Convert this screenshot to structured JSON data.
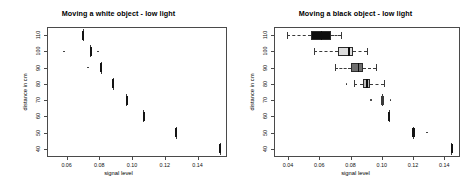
{
  "figure": {
    "panel_count": 2,
    "background": "#ffffff",
    "frame_color": "#4a4a4a"
  },
  "panels": [
    {
      "id": "white-object-panel",
      "title": "Moving a white object - low light",
      "xlabel": "signal level",
      "ylabel": "distance in cm",
      "xticks": [
        "0.06",
        "0.08",
        "0.10",
        "0.12",
        "0.14"
      ],
      "yticks": [
        "110",
        "100",
        "90",
        "80",
        "70",
        "60",
        "50",
        "40"
      ]
    },
    {
      "id": "black-object-panel",
      "title": "Moving a black object - low light",
      "xlabel": "signal level",
      "ylabel": "distance in cm",
      "xticks": [
        "0.04",
        "0.06",
        "0.08",
        "0.10",
        "0.12",
        "0.14"
      ],
      "yticks": [
        "110",
        "100",
        "90",
        "80",
        "70",
        "60",
        "50",
        "40"
      ]
    }
  ],
  "chart_data": [
    {
      "type": "boxplot",
      "orientation": "horizontal",
      "title": "Moving a white object - low light",
      "xlabel": "signal level",
      "ylabel": "distance in cm",
      "xlim": [
        0.048,
        0.158
      ],
      "ylim": [
        35,
        115
      ],
      "grid": false,
      "legend": "none",
      "categories": [
        110,
        100,
        90,
        80,
        70,
        60,
        50,
        40
      ],
      "boxes": [
        {
          "category": 110,
          "min": 0.0695,
          "q1": 0.07,
          "median": 0.0702,
          "q3": 0.0705,
          "max": 0.071,
          "fill": "#141414",
          "outliers": []
        },
        {
          "category": 100,
          "min": 0.074,
          "q1": 0.0744,
          "median": 0.0746,
          "q3": 0.0749,
          "max": 0.0754,
          "fill": "#141414",
          "outliers": [
            0.0585,
            0.0792
          ]
        },
        {
          "category": 90,
          "min": 0.0806,
          "q1": 0.081,
          "median": 0.0812,
          "q3": 0.0815,
          "max": 0.082,
          "fill": "#141414",
          "outliers": [
            0.073
          ]
        },
        {
          "category": 80,
          "min": 0.0878,
          "q1": 0.0882,
          "median": 0.0884,
          "q3": 0.0887,
          "max": 0.0892,
          "fill": "#141414",
          "outliers": []
        },
        {
          "category": 70,
          "min": 0.0962,
          "q1": 0.0966,
          "median": 0.0968,
          "q3": 0.0971,
          "max": 0.0977,
          "fill": "#141414",
          "outliers": []
        },
        {
          "category": 60,
          "min": 0.1064,
          "q1": 0.1068,
          "median": 0.107,
          "q3": 0.1073,
          "max": 0.108,
          "fill": "#141414",
          "outliers": []
        },
        {
          "category": 50,
          "min": 0.1262,
          "q1": 0.1266,
          "median": 0.1269,
          "q3": 0.1272,
          "max": 0.1279,
          "fill": "#141414",
          "outliers": []
        },
        {
          "category": 40,
          "min": 0.153,
          "q1": 0.1535,
          "median": 0.1538,
          "q3": 0.1541,
          "max": 0.1548,
          "fill": "#141414",
          "outliers": []
        }
      ]
    },
    {
      "type": "boxplot",
      "orientation": "horizontal",
      "title": "Moving a black object - low light",
      "xlabel": "signal level",
      "ylabel": "distance in cm",
      "xlim": [
        0.031,
        0.15
      ],
      "ylim": [
        35,
        115
      ],
      "grid": false,
      "legend": "none",
      "categories": [
        110,
        100,
        90,
        80,
        70,
        60,
        50,
        40
      ],
      "boxes": [
        {
          "category": 110,
          "min": 0.039,
          "q1": 0.0545,
          "median": 0.0615,
          "q3": 0.0672,
          "max": 0.074,
          "fill": "#0d0d0d",
          "outliers": []
        },
        {
          "category": 100,
          "min": 0.0565,
          "q1": 0.072,
          "median": 0.079,
          "q3": 0.0815,
          "max": 0.0905,
          "fill": "#dcdcdc",
          "outliers": []
        },
        {
          "category": 90,
          "min": 0.07,
          "q1": 0.08,
          "median": 0.085,
          "q3": 0.088,
          "max": 0.0965,
          "fill": "#6e6e6e",
          "outliers": []
        },
        {
          "category": 80,
          "min": 0.082,
          "q1": 0.088,
          "median": 0.0905,
          "q3": 0.0925,
          "max": 0.1015,
          "fill": "#bdbdbd",
          "outliers": [
            0.0775
          ]
        },
        {
          "category": 70,
          "min": 0.0985,
          "q1": 0.1,
          "median": 0.1005,
          "q3": 0.101,
          "max": 0.103,
          "fill": "#3a3a3a",
          "outliers": [
            0.093,
            0.1055
          ]
        },
        {
          "category": 60,
          "min": 0.104,
          "q1": 0.1044,
          "median": 0.1046,
          "q3": 0.1049,
          "max": 0.1055,
          "fill": "#141414",
          "outliers": []
        },
        {
          "category": 50,
          "min": 0.1185,
          "q1": 0.1195,
          "median": 0.12,
          "q3": 0.1206,
          "max": 0.1216,
          "fill": "#141414",
          "outliers": [
            0.129
          ]
        },
        {
          "category": 40,
          "min": 0.144,
          "q1": 0.1445,
          "median": 0.1448,
          "q3": 0.1451,
          "max": 0.1458,
          "fill": "#141414",
          "outliers": []
        }
      ]
    }
  ]
}
